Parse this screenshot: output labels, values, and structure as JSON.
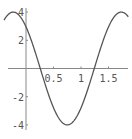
{
  "chart_data": {
    "type": "line",
    "title": "",
    "xlabel": "",
    "ylabel": "",
    "function_estimate": "4*cos(3.2*x + 0.74)",
    "xlim": [
      -0.45,
      1.88
    ],
    "ylim": [
      -4.2,
      4.3
    ],
    "x_ticks": [
      0.5,
      1,
      1.5
    ],
    "x_tick_labels": [
      "0.5",
      "1",
      "1.5"
    ],
    "y_ticks": [
      4,
      2,
      -2,
      -4
    ],
    "y_tick_labels": [
      "4",
      "2",
      "-2",
      "-4"
    ],
    "grid": false,
    "legend": null,
    "series": [
      {
        "name": "curve",
        "color": "#555555",
        "x": [
          -0.4,
          -0.23,
          0.0,
          0.26,
          0.5,
          0.75,
          1.0,
          1.24,
          1.5,
          1.73,
          1.85
        ],
        "y": [
          3.8,
          4.0,
          2.95,
          0.0,
          -2.5,
          -4.0,
          -2.9,
          0.0,
          2.6,
          4.0,
          3.7
        ]
      }
    ]
  },
  "axes": {
    "x_labels": [
      "0.5",
      "1",
      "1.5"
    ],
    "y_labels": [
      "4",
      "2",
      "-2",
      "-4"
    ]
  }
}
